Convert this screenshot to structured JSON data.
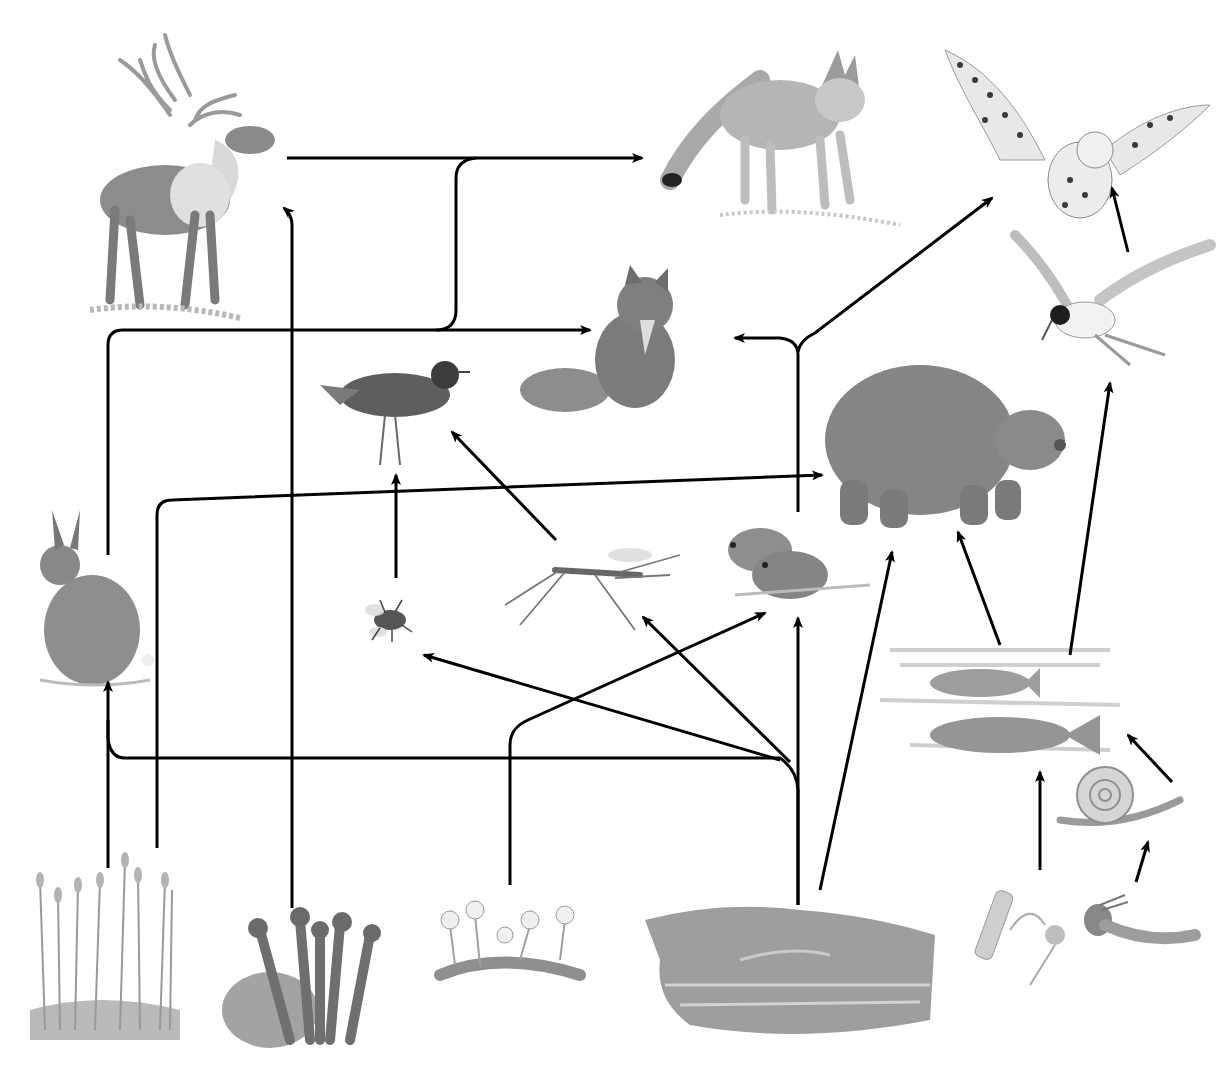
{
  "diagram": {
    "type": "food-web",
    "ink_color": "#000000",
    "organisms": [
      {
        "id": "caribou",
        "label": "Caribou",
        "cx": 190,
        "cy": 190
      },
      {
        "id": "wolf",
        "label": "Wolf",
        "cx": 790,
        "cy": 130
      },
      {
        "id": "snowy-owl",
        "label": "Snowy owl",
        "cx": 1060,
        "cy": 100
      },
      {
        "id": "arctic-fox",
        "label": "Arctic fox",
        "cx": 610,
        "cy": 345
      },
      {
        "id": "arctic-tern",
        "label": "Arctic tern",
        "cx": 1090,
        "cy": 300
      },
      {
        "id": "plover",
        "label": "Golden plover",
        "cx": 395,
        "cy": 410
      },
      {
        "id": "grizzly-bear",
        "label": "Grizzly bear",
        "cx": 940,
        "cy": 440
      },
      {
        "id": "arctic-hare",
        "label": "Arctic hare",
        "cx": 90,
        "cy": 610
      },
      {
        "id": "fly",
        "label": "Fly",
        "cx": 390,
        "cy": 625
      },
      {
        "id": "mosquito",
        "label": "Mosquito",
        "cx": 590,
        "cy": 580
      },
      {
        "id": "lemmings",
        "label": "Lemmings",
        "cx": 790,
        "cy": 565
      },
      {
        "id": "fish",
        "label": "Fish",
        "cx": 1000,
        "cy": 700
      },
      {
        "id": "snail",
        "label": "Snail",
        "cx": 1120,
        "cy": 790
      },
      {
        "id": "mosses",
        "label": "Mosses",
        "cx": 100,
        "cy": 945
      },
      {
        "id": "lichens",
        "label": "Lichens",
        "cx": 310,
        "cy": 990
      },
      {
        "id": "flowers",
        "label": "Flowering plants",
        "cx": 510,
        "cy": 955
      },
      {
        "id": "grasses-sedges",
        "label": "Grasses and sedges",
        "cx": 790,
        "cy": 975
      },
      {
        "id": "plankton",
        "label": "Plankton",
        "cx": 1050,
        "cy": 960
      },
      {
        "id": "insect-larva",
        "label": "Aquatic insect larva",
        "cx": 1140,
        "cy": 955
      }
    ],
    "links": [
      {
        "from": "caribou",
        "to": "wolf"
      },
      {
        "from": "arctic-hare",
        "to": "wolf"
      },
      {
        "from": "arctic-hare",
        "to": "arctic-fox"
      },
      {
        "from": "lemmings",
        "to": "arctic-fox"
      },
      {
        "from": "lemmings",
        "to": "snowy-owl"
      },
      {
        "from": "arctic-tern",
        "to": "snowy-owl"
      },
      {
        "from": "fish",
        "to": "arctic-tern"
      },
      {
        "from": "fish",
        "to": "grizzly-bear"
      },
      {
        "from": "mosses",
        "to": "grizzly-bear"
      },
      {
        "from": "mosses",
        "to": "arctic-hare"
      },
      {
        "from": "lichens",
        "to": "caribou"
      },
      {
        "from": "fly",
        "to": "plover"
      },
      {
        "from": "mosquito",
        "to": "plover"
      },
      {
        "from": "flowers",
        "to": "lemmings"
      },
      {
        "from": "grasses-sedges",
        "to": "arctic-hare"
      },
      {
        "from": "grasses-sedges",
        "to": "fly"
      },
      {
        "from": "grasses-sedges",
        "to": "mosquito"
      },
      {
        "from": "grasses-sedges",
        "to": "lemmings"
      },
      {
        "from": "grasses-sedges",
        "to": "grizzly-bear"
      },
      {
        "from": "plankton",
        "to": "fish"
      },
      {
        "from": "insect-larva",
        "to": "snail"
      },
      {
        "from": "snail",
        "to": "fish"
      }
    ]
  }
}
